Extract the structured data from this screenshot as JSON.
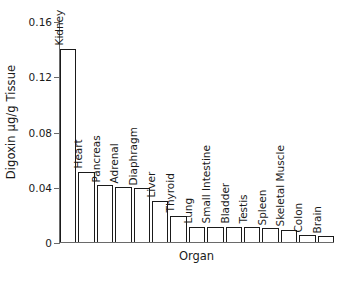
{
  "chart_data": {
    "type": "bar",
    "title": "",
    "xlabel": "Organ",
    "ylabel": "Digoxin µg/g Tissue",
    "ylim": [
      0,
      0.16
    ],
    "yticks": [
      "0",
      "0.04",
      "0.08",
      "0.12",
      "0.16"
    ],
    "ytick_values": [
      0,
      0.04,
      0.08,
      0.12,
      0.16
    ],
    "grid": false,
    "legend": "none",
    "categories": [
      "Kidney",
      "Heart",
      "Pancreas",
      "Adrenal",
      "Diaphragm",
      "Liver",
      "Thyroid",
      "Lung",
      "Small Intestine",
      "Bladder",
      "Testis",
      "Spleen",
      "Skeletal Muscle",
      "Colon",
      "Brain"
    ],
    "values": [
      0.14,
      0.051,
      0.041,
      0.04,
      0.039,
      0.03,
      0.019,
      0.011,
      0.011,
      0.011,
      0.011,
      0.01,
      0.009,
      0.005,
      0.004
    ],
    "bar_style": {
      "fill": "#ffffff",
      "edge": "#1a1a1a",
      "edge_width": 1
    }
  },
  "axes": {
    "line_color": "#6a6a6a"
  }
}
